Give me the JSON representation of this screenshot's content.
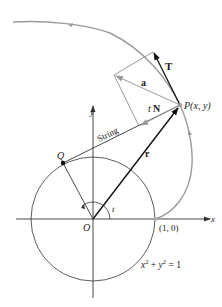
{
  "diagram": {
    "type": "involute-of-circle",
    "colors": {
      "curve": "#9a9a9a",
      "axis": "#333333",
      "vector": "#111111",
      "construction": "#9a9a9a",
      "background": "#ffffff"
    },
    "labels": {
      "T": "T",
      "a": "a",
      "P": "P(x, y)",
      "tN_t": "t",
      "tN_N": "N",
      "string": "String",
      "y_axis": "y",
      "x_axis": "x",
      "Q": "Q",
      "r": "r",
      "t_angle": "t",
      "O": "O",
      "point_1_0": "(1, 0)",
      "equation_x": "x",
      "equation_plus": " + ",
      "equation_y": "y",
      "equation_eq": " = 1",
      "sup2": "2"
    }
  }
}
